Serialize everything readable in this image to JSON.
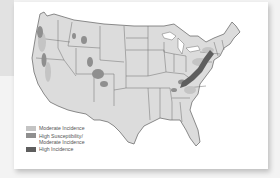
{
  "figure": {
    "type": "map",
    "region": "Contiguous United States",
    "map_fill": "#dcdcdc",
    "border_color": "#6e6e6e"
  },
  "legend": {
    "items": [
      {
        "label": "Moderate Incidence",
        "color": "#c4c4c4"
      },
      {
        "label": "High Susceptibility/\nModerate Incidence",
        "color": "#8f8f8f"
      },
      {
        "label": "High Incidence",
        "color": "#5e5e5e"
      }
    ]
  },
  "colors": {
    "page_background": "#f3f3f3",
    "card_background": "#ffffff",
    "side_tab": "#e2e2e2"
  }
}
